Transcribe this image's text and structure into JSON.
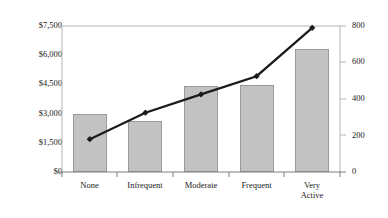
{
  "chart_data": {
    "type": "bar",
    "title": "",
    "xlabel": "",
    "ylabel": "",
    "grid": false,
    "legend": "none",
    "categories": [
      "None",
      "Infrequent",
      "Moderate",
      "Frequent",
      "Very\nActive"
    ],
    "series": [
      {
        "name": "Dollars",
        "type": "bar",
        "axis": "left",
        "values": [
          3000,
          2600,
          4400,
          4450,
          6300
        ]
      },
      {
        "name": "Count",
        "type": "line",
        "axis": "right",
        "values": [
          180,
          325,
          425,
          525,
          790
        ]
      }
    ],
    "left_axis": {
      "ticks": [
        "$0",
        "$1,500",
        "$3,000",
        "$4,500",
        "$6,000",
        "$7,500"
      ],
      "tick_values": [
        0,
        1500,
        3000,
        4500,
        6000,
        7500
      ],
      "ylim": [
        0,
        7500
      ]
    },
    "right_axis": {
      "ticks": [
        "0",
        "200",
        "400",
        "600",
        "800"
      ],
      "tick_values": [
        0,
        200,
        400,
        600,
        800
      ],
      "ylim": [
        0,
        800
      ]
    },
    "colors": {
      "bar_fill": "#c2c2c2",
      "bar_border": "#9a9a9a",
      "line": "#1a1a1a",
      "axis": "#b5b5b5",
      "text": "#1a1a1a",
      "background": "#ffffff"
    }
  }
}
